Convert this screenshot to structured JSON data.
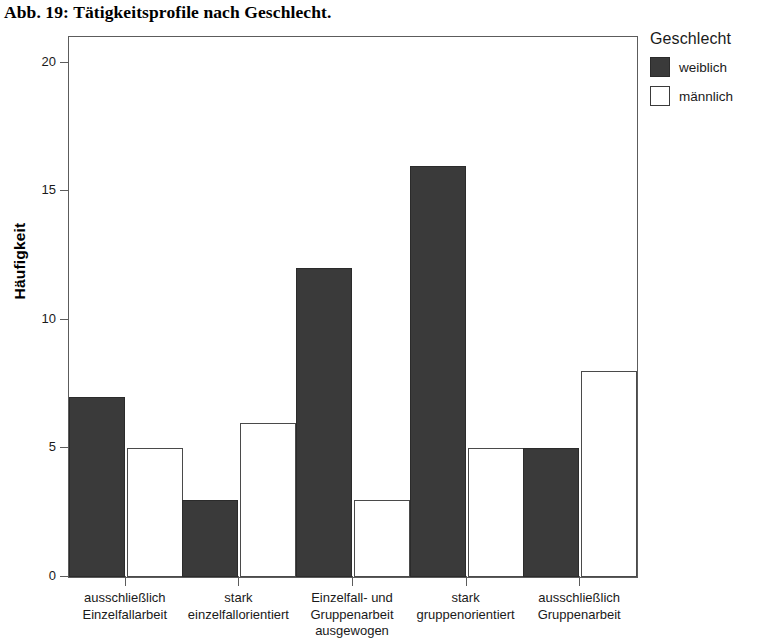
{
  "title": "Abb. 19: Tätigkeitsprofile nach Geschlecht.",
  "legend": {
    "title": "Geschlecht",
    "entries": [
      {
        "label": "weiblich",
        "color": "#3a3a3a"
      },
      {
        "label": "männlich",
        "color": "#ffffff"
      }
    ]
  },
  "axes": {
    "ylabel": "Häufigkeit",
    "yticks": [
      "0",
      "5",
      "10",
      "15",
      "20"
    ]
  },
  "chart_data": {
    "type": "bar",
    "title": "Abb. 19: Tätigkeitsprofile nach Geschlecht.",
    "xlabel": "",
    "ylabel": "Häufigkeit",
    "ylim": [
      0,
      21
    ],
    "ytick_values": [
      0,
      5,
      10,
      15,
      20
    ],
    "grid": false,
    "legend_position": "right",
    "legend_title": "Geschlecht",
    "categories": [
      "ausschließlich\nEinzelfallarbeit",
      "stark\neinzelfallorientiert",
      "Einzelfall- und\nGruppenarbeit\nausgewogen",
      "stark\ngruppenorientiert",
      "ausschließlich\nGruppenarbeit"
    ],
    "series": [
      {
        "name": "weiblich",
        "color": "#3a3a3a",
        "values": [
          7,
          3,
          12,
          16,
          5
        ]
      },
      {
        "name": "männlich",
        "color": "#ffffff",
        "values": [
          5,
          6,
          3,
          5,
          8
        ]
      }
    ]
  }
}
